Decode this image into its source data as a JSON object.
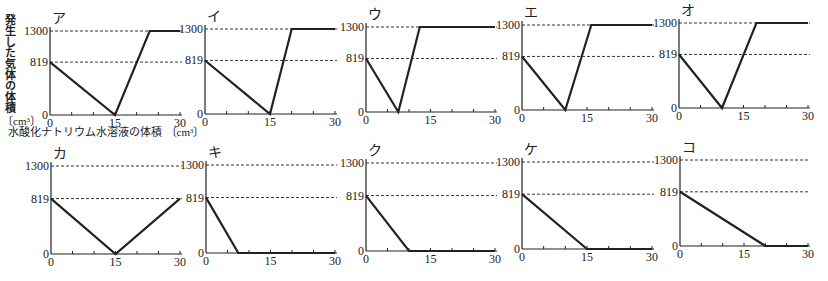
{
  "ylabel": "発生した気体の体積",
  "yunit": "〔cm³〕",
  "xlabel": "水酸化ナトリウム水溶液の体積",
  "xunit": "〔cm³〕",
  "chart_data": [
    {
      "type": "line",
      "title": "ア",
      "x": [
        0,
        15,
        23,
        30
      ],
      "y": [
        819,
        0,
        1300,
        1300
      ],
      "xticks": [
        0,
        15,
        30
      ],
      "yticks": [
        0,
        819,
        1300
      ],
      "xlim": [
        0,
        30
      ],
      "ylim": [
        0,
        1300
      ],
      "dashed_reference_lines": [
        819,
        1300
      ]
    },
    {
      "type": "line",
      "title": "イ",
      "x": [
        0,
        15,
        20,
        30
      ],
      "y": [
        819,
        0,
        1300,
        1300
      ],
      "xticks": [
        0,
        15,
        30
      ],
      "yticks": [
        0,
        819,
        1300
      ],
      "xlim": [
        0,
        30
      ],
      "ylim": [
        0,
        1300
      ],
      "dashed_reference_lines": [
        819,
        1300
      ]
    },
    {
      "type": "line",
      "title": "ウ",
      "x": [
        0,
        7.5,
        12.5,
        30
      ],
      "y": [
        819,
        0,
        1300,
        1300
      ],
      "xticks": [
        0,
        15,
        30
      ],
      "yticks": [
        0,
        819,
        1300
      ],
      "xlim": [
        0,
        30
      ],
      "ylim": [
        0,
        1300
      ],
      "dashed_reference_lines": [
        819,
        1300
      ]
    },
    {
      "type": "line",
      "title": "エ",
      "x": [
        0,
        10,
        16,
        30
      ],
      "y": [
        819,
        0,
        1300,
        1300
      ],
      "xticks": [
        0,
        15,
        30
      ],
      "yticks": [
        0,
        819,
        1300
      ],
      "xlim": [
        0,
        30
      ],
      "ylim": [
        0,
        1300
      ],
      "dashed_reference_lines": [
        819,
        1300
      ]
    },
    {
      "type": "line",
      "title": "オ",
      "x": [
        0,
        10,
        18,
        30
      ],
      "y": [
        819,
        0,
        1300,
        1300
      ],
      "xticks": [
        0,
        15,
        30
      ],
      "yticks": [
        0,
        819,
        1300
      ],
      "xlim": [
        0,
        30
      ],
      "ylim": [
        0,
        1300
      ],
      "dashed_reference_lines": [
        819,
        1300
      ]
    },
    {
      "type": "line",
      "title": "カ",
      "x": [
        0,
        15,
        30
      ],
      "y": [
        819,
        0,
        819
      ],
      "xticks": [
        0,
        15,
        30
      ],
      "yticks": [
        0,
        819,
        1300
      ],
      "xlim": [
        0,
        30
      ],
      "ylim": [
        0,
        1300
      ],
      "dashed_reference_lines": [
        819,
        1300
      ]
    },
    {
      "type": "line",
      "title": "キ",
      "x": [
        0,
        7.5,
        30
      ],
      "y": [
        819,
        0,
        0
      ],
      "xticks": [
        0,
        15,
        30
      ],
      "yticks": [
        0,
        819,
        1300
      ],
      "xlim": [
        0,
        30
      ],
      "ylim": [
        0,
        1300
      ],
      "dashed_reference_lines": [
        819,
        1300
      ]
    },
    {
      "type": "line",
      "title": "ク",
      "x": [
        0,
        10,
        30
      ],
      "y": [
        819,
        0,
        0
      ],
      "xticks": [
        0,
        15,
        30
      ],
      "yticks": [
        0,
        819,
        1300
      ],
      "xlim": [
        0,
        30
      ],
      "ylim": [
        0,
        1300
      ],
      "dashed_reference_lines": [
        819,
        1300
      ]
    },
    {
      "type": "line",
      "title": "ケ",
      "x": [
        0,
        15,
        30
      ],
      "y": [
        819,
        0,
        0
      ],
      "xticks": [
        0,
        15,
        30
      ],
      "yticks": [
        0,
        819,
        1300
      ],
      "xlim": [
        0,
        30
      ],
      "ylim": [
        0,
        1300
      ],
      "dashed_reference_lines": [
        819,
        1300
      ]
    },
    {
      "type": "line",
      "title": "コ",
      "x": [
        0,
        20,
        30
      ],
      "y": [
        819,
        0,
        0
      ],
      "xticks": [
        0,
        15,
        30
      ],
      "yticks": [
        0,
        819,
        1300
      ],
      "xlim": [
        0,
        30
      ],
      "ylim": [
        0,
        1300
      ],
      "dashed_reference_lines": [
        819,
        1300
      ]
    }
  ],
  "layout": [
    {
      "x0": 50,
      "x30": 180,
      "y0": 115,
      "ytop": 31
    },
    {
      "x0": 205,
      "x30": 335,
      "y0": 114,
      "ytop": 29
    },
    {
      "x0": 366,
      "x30": 495,
      "y0": 112,
      "ytop": 27
    },
    {
      "x0": 522,
      "x30": 652,
      "y0": 110,
      "ytop": 25
    },
    {
      "x0": 679,
      "x30": 808,
      "y0": 108,
      "ytop": 23
    },
    {
      "x0": 51,
      "x30": 180,
      "y0": 254,
      "ytop": 166
    },
    {
      "x0": 206,
      "x30": 335,
      "y0": 253,
      "ytop": 165
    },
    {
      "x0": 366,
      "x30": 495,
      "y0": 251,
      "ytop": 163
    },
    {
      "x0": 522,
      "x30": 652,
      "y0": 249,
      "ytop": 162
    },
    {
      "x0": 680,
      "x30": 808,
      "y0": 246,
      "ytop": 160
    }
  ]
}
